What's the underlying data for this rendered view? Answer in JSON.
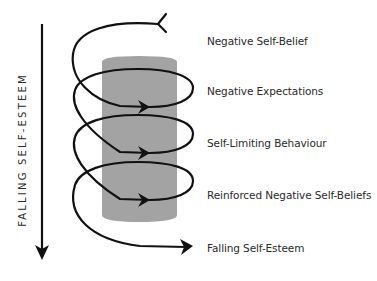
{
  "diagram": {
    "axis_label": "FALLING SELF-ESTEEM",
    "stages": [
      {
        "label": "Negative Self-Belief",
        "y": 35
      },
      {
        "label": "Negative Expectations",
        "y": 85
      },
      {
        "label": "Self-Limiting Behaviour",
        "y": 137
      },
      {
        "label": "Reinforced Negative Self-Beliefs",
        "y": 189
      },
      {
        "label": "Falling Self-Esteem",
        "y": 242
      }
    ],
    "colors": {
      "line": "#111111",
      "cylinder": "#a3a3a3",
      "text": "#2a2a2a"
    }
  }
}
